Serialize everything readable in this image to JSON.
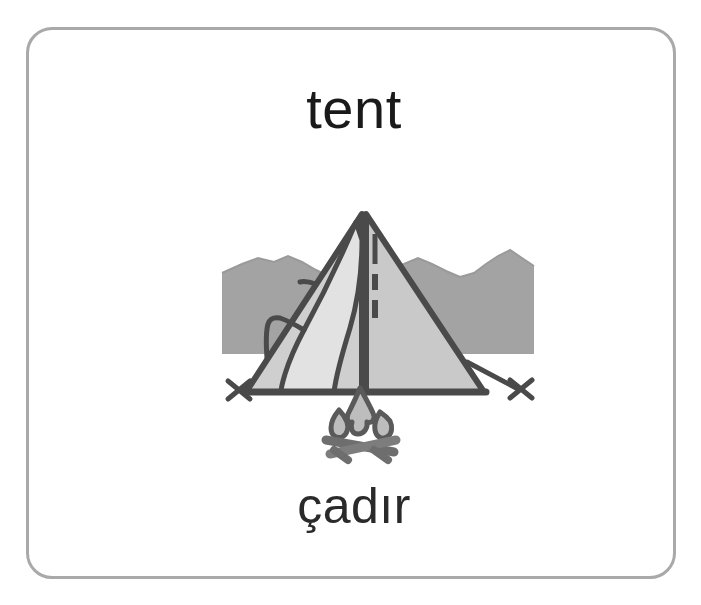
{
  "card": {
    "headword": "tent",
    "translation": "çadır",
    "border_color": "#a9a9a9",
    "background_color": "#ffffff"
  },
  "illustration": {
    "name": "tent-illustration",
    "alt_label": "tent with campfire in front of mountains",
    "parts": [
      {
        "name": "mountains-background",
        "color": "#a3a3a3"
      },
      {
        "name": "tent-right-panel",
        "color": "#c9c9c9"
      },
      {
        "name": "tent-left-panel",
        "color": "#cfcfcf"
      },
      {
        "name": "tent-door-flap",
        "color": "#e2e2e2"
      },
      {
        "name": "tent-outline",
        "color": "#4a4a4a"
      },
      {
        "name": "guy-line-left",
        "color": "#4a4a4a"
      },
      {
        "name": "guy-line-right",
        "color": "#4a4a4a"
      },
      {
        "name": "stake-left",
        "color": "#4a4a4a"
      },
      {
        "name": "stake-right",
        "color": "#4a4a4a"
      },
      {
        "name": "center-pole",
        "color": "#4a4a4a"
      },
      {
        "name": "campfire-flame",
        "color": "#bdbdbd"
      },
      {
        "name": "campfire-logs",
        "color": "#8c8c8c"
      }
    ]
  }
}
